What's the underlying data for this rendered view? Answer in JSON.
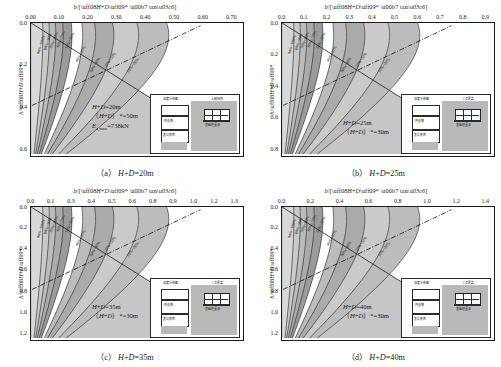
{
  "figure": {
    "axis": {
      "x_label_prefix": "b/[",
      "x_label_core": "(H+D)",
      "x_label_star": "*",
      "x_label_mid": " · tan",
      "x_label_phi": "φ",
      "x_label_suffix": "]",
      "y_label_prefix": "h/",
      "y_label_core": "(H+D)",
      "y_label_star": "*"
    },
    "colors": {
      "background": "#ffffff",
      "axis": "#1c1c1c",
      "band_lightest": "#d8d8d8",
      "band_light": "#cacaca",
      "band_mid": "#bcbcbc",
      "band_dark": "#ababab",
      "band_darkest": "#9b9b9b",
      "band_white": "#ffffff",
      "outer_zone": "#c6c6c6",
      "contour_line": "#1f1f1f",
      "dashdot_line": "#111111",
      "inset_soil": "#b9b9b9"
    },
    "contour_labels": [
      "90%~100%",
      "80%~90%",
      "70%~80%",
      "60%~70%",
      "50%~60%",
      "40%~50%",
      "30%~40%",
      "20%~30%",
      "10%~20%",
      "0~10%"
    ]
  },
  "panels": [
    {
      "id": "a",
      "caption_tag": "（a）",
      "caption_text": "H+D=20m",
      "x_ticks": [
        "0.00",
        "0.10",
        "0.20",
        "0.30",
        "0.40",
        "0.50",
        "0.60",
        "0.70"
      ],
      "x_min": 0.0,
      "x_max": 0.7,
      "y_ticks": [
        "0.0",
        "0.2",
        "0.4",
        "0.6"
      ],
      "y_min": 0.0,
      "y_max": 0.68,
      "annotations": [
        {
          "text": "H+D=20m"
        },
        {
          "text": "（H+D）*=50m"
        },
        {
          "text": "Ea,max=738kN"
        }
      ],
      "contour_labels": [
        "90%~100%",
        "80%~90%",
        "70%~80%",
        "60%~70%",
        "50%~60%",
        "40%~50%",
        "30%~40%",
        "20%~30%",
        "10%~20%",
        "0~10%"
      ],
      "inset": {
        "label_left": "深度分布图",
        "label_right": "上部结构",
        "layer_mid": "内支撐",
        "layer_bottom": "基坑底面",
        "foundation": "基础埋置深"
      }
    },
    {
      "id": "b",
      "caption_tag": "（b）",
      "caption_text": "H+D=25m",
      "x_ticks": [
        "0.0",
        "0.1",
        "0.2",
        "0.3",
        "0.4",
        "0.5",
        "0.6",
        "0.7",
        "0.8",
        "0.9"
      ],
      "x_min": 0.0,
      "x_max": 0.9,
      "y_ticks": [
        "0.0",
        "0.2",
        "0.4",
        "0.6",
        "0.8"
      ],
      "y_min": 0.0,
      "y_max": 0.88,
      "annotations": [
        {
          "text": "H+D=25m"
        },
        {
          "text": "（H+D）*=30m"
        }
      ],
      "contour_labels": [
        "90%~100%",
        "80%~90%",
        "70%~80%",
        "60%~70%",
        "50%~60%",
        "40%~50%",
        "30%~40%",
        "20%~30%",
        "10%~20%",
        "0~10%"
      ],
      "inset": {
        "label_left": "深度分布图",
        "label_right": "二次覆盖",
        "layer_mid": "内支撐",
        "layer_bottom": "基坑底面",
        "foundation": "基础埋置深"
      }
    },
    {
      "id": "c",
      "caption_tag": "（c）",
      "caption_text": "H+D=35m",
      "x_ticks": [
        "0.0",
        "0.1",
        "0.3",
        "0.4",
        "0.5",
        "0.6",
        "0.8",
        "0.9",
        "1.0",
        "1.2",
        "1.3"
      ],
      "x_min": 0.0,
      "x_max": 1.3,
      "y_ticks": [
        "0.0",
        "0.2",
        "0.4",
        "0.6",
        "0.8",
        "1.0",
        "1.2"
      ],
      "y_min": 0.0,
      "y_max": 1.28,
      "annotations": [
        {
          "text": "H+D=35m"
        },
        {
          "text": "（H+D）*=30m"
        }
      ],
      "contour_labels": [
        "90%~100%",
        "80%~90%",
        "70%~80%",
        "60%~70%",
        "50%~60%",
        "40%~50%",
        "30%~40%",
        "20%~30%",
        "10%~20%",
        "0~10%"
      ],
      "inset": {
        "label_left": "深度分布图",
        "label_right": "二次覆盖",
        "layer_mid": "内支撐",
        "layer_bottom": "基坑底面",
        "foundation": "基础埋置深"
      }
    },
    {
      "id": "d",
      "caption_tag": "（d）",
      "caption_text": "H+D=40m",
      "x_ticks": [
        "0.0",
        "0.2",
        "0.4",
        "0.6",
        "0.8",
        "1.0",
        "1.2",
        "1.4"
      ],
      "x_min": 0.0,
      "x_max": 1.4,
      "y_ticks": [
        "0.0",
        "0.2",
        "0.4",
        "0.6",
        "0.8",
        "1.0",
        "1.2"
      ],
      "y_min": 0.0,
      "y_max": 1.3,
      "annotations": [
        {
          "text": "H+D=40m"
        },
        {
          "text": "（H+D）*=30m"
        }
      ],
      "contour_labels": [
        "90%~100%",
        "80%~90%",
        "70%~80%",
        "60%~70%",
        "50%~60%",
        "40%~50%",
        "30%~40%",
        "20%~30%",
        "10%~20%",
        "0~10%"
      ],
      "inset": {
        "label_left": "深度分布图",
        "label_right": "二次覆盖",
        "layer_mid": "内支撐",
        "layer_bottom": "基坑底面",
        "foundation": "基础埋置深"
      }
    }
  ],
  "chart_data": {
    "type": "heatmap",
    "xlabel": "b/[(H+D)* · tanφ]",
    "ylabel": "h/(H+D)*",
    "grid": false,
    "legend": "none",
    "bands_percent": [
      "0~10%",
      "10%~20%",
      "20%~30%",
      "30%~40%",
      "40%~50%",
      "50%~60%",
      "60%~70%",
      "70%~80%",
      "80%~90%",
      "90%~100%"
    ],
    "subplots": [
      {
        "label": "(a) H+D=20m",
        "xlim": [
          0,
          0.7
        ],
        "ylim": [
          0,
          0.68
        ],
        "params": {
          "H_plus_D": 20,
          "H_plus_D_star": 50,
          "Ea_max_kN": 738
        },
        "boundary_slope": 1.0
      },
      {
        "label": "(b) H+D=25m",
        "xlim": [
          0,
          0.9
        ],
        "ylim": [
          0,
          0.88
        ],
        "params": {
          "H_plus_D": 25,
          "H_plus_D_star": 30
        },
        "boundary_slope": 1.0
      },
      {
        "label": "(c) H+D=35m",
        "xlim": [
          0,
          1.3
        ],
        "ylim": [
          0,
          1.28
        ],
        "params": {
          "H_plus_D": 35,
          "H_plus_D_star": 30
        },
        "boundary_slope": 1.0
      },
      {
        "label": "(d) H+D=40m",
        "xlim": [
          0,
          1.4
        ],
        "ylim": [
          0,
          1.3
        ],
        "params": {
          "H_plus_D": 40,
          "H_plus_D_star": 30
        },
        "boundary_slope": 1.0
      }
    ]
  }
}
